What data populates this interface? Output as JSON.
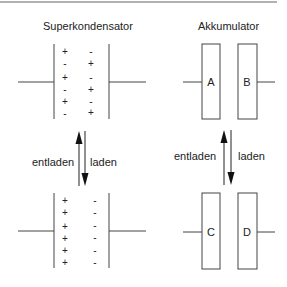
{
  "diagram": {
    "top_rule": true,
    "supercap": {
      "title": "Superkondensator",
      "charged": {
        "left_column": [
          "+",
          "-",
          "+",
          "-",
          "+",
          "-"
        ],
        "right_column": [
          "-",
          "+",
          "-",
          "+",
          "-",
          "+"
        ]
      },
      "discharged": {
        "left_column": [
          "+",
          "+",
          "+",
          "+",
          "+",
          "+"
        ],
        "right_column": [
          "-",
          "-",
          "-",
          "-",
          "-",
          "-"
        ]
      },
      "arrows": {
        "up_label": "entladen",
        "down_label": "laden"
      }
    },
    "battery": {
      "title": "Akkumulator",
      "top_electrodes": [
        "A",
        "B"
      ],
      "bottom_electrodes": [
        "C",
        "D"
      ],
      "arrows": {
        "up_label": "entladen",
        "down_label": "laden"
      }
    },
    "colors": {
      "line": "#333333",
      "rule": "#999999",
      "background": "#ffffff"
    }
  }
}
